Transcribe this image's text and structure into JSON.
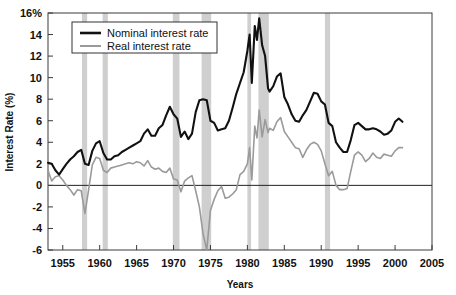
{
  "chart_data": {
    "type": "line",
    "title": "",
    "xlabel": "Years",
    "ylabel": "Interest Rate (%)",
    "xlim": [
      1953,
      2005
    ],
    "ylim": [
      -6,
      16
    ],
    "grid": false,
    "legend_position": "top-left-inside",
    "x_ticks": [
      1955,
      1960,
      1965,
      1970,
      1975,
      1980,
      1985,
      1990,
      1995,
      2000,
      2005
    ],
    "x_tick_labels": [
      "1955",
      "1960",
      "1965",
      "1970",
      "1975",
      "1980",
      "1985",
      "1990",
      "1995",
      "2000",
      "2005"
    ],
    "y_ticks": [
      -6,
      -4,
      -2,
      0,
      2,
      4,
      6,
      8,
      10,
      12,
      14,
      16
    ],
    "y_tick_labels": [
      "-6",
      "-4",
      "-2",
      "0",
      "2",
      "4",
      "6",
      "8",
      "10",
      "12",
      "14",
      "16%"
    ],
    "colors": {
      "nominal": "#111111",
      "real": "#9a9a9a",
      "recession_band": "#cfcfcf",
      "axis": "#3a3a3a",
      "background": "#ffffff"
    },
    "shaded_regions": {
      "name": "recession-bands",
      "spans": [
        [
          1957.6,
          1958.3
        ],
        [
          1960.4,
          1961.1
        ],
        [
          1969.9,
          1970.8
        ],
        [
          1973.8,
          1975.1
        ],
        [
          1980.0,
          1980.5
        ],
        [
          1981.5,
          1982.9
        ],
        [
          1990.5,
          1991.2
        ]
      ]
    },
    "series": [
      {
        "name": "Nominal interest rate",
        "color": "#111111",
        "x": [
          1953.0,
          1953.5,
          1954.0,
          1954.5,
          1955.0,
          1955.5,
          1956.0,
          1956.5,
          1957.0,
          1957.5,
          1958.0,
          1958.5,
          1959.0,
          1959.5,
          1960.0,
          1960.5,
          1961.0,
          1961.5,
          1962.0,
          1962.5,
          1963.0,
          1963.5,
          1964.0,
          1964.5,
          1965.0,
          1965.5,
          1966.0,
          1966.5,
          1967.0,
          1967.5,
          1968.0,
          1968.5,
          1969.0,
          1969.5,
          1970.0,
          1970.5,
          1971.0,
          1971.5,
          1972.0,
          1972.5,
          1973.0,
          1973.5,
          1974.0,
          1974.5,
          1975.0,
          1975.5,
          1976.0,
          1976.5,
          1977.0,
          1977.5,
          1978.0,
          1978.5,
          1979.0,
          1979.5,
          1980.0,
          1980.3,
          1980.6,
          1981.0,
          1981.3,
          1981.6,
          1982.0,
          1982.4,
          1982.8,
          1983.0,
          1983.5,
          1984.0,
          1984.5,
          1985.0,
          1985.5,
          1986.0,
          1986.5,
          1987.0,
          1987.5,
          1988.0,
          1988.5,
          1989.0,
          1989.5,
          1990.0,
          1990.5,
          1991.0,
          1991.5,
          1992.0,
          1992.5,
          1993.0,
          1993.5,
          1994.0,
          1994.5,
          1995.0,
          1995.5,
          1996.0,
          1996.5,
          1997.0,
          1997.5,
          1998.0,
          1998.5,
          1999.0,
          1999.5,
          2000.0,
          2000.5,
          2001.0
        ],
        "y": [
          2.1,
          2.0,
          1.4,
          1.0,
          1.5,
          2.0,
          2.4,
          2.7,
          3.1,
          3.3,
          2.0,
          1.9,
          3.2,
          3.9,
          4.1,
          3.0,
          2.4,
          2.4,
          2.7,
          2.8,
          3.1,
          3.3,
          3.5,
          3.7,
          3.9,
          4.1,
          4.8,
          5.2,
          4.6,
          4.6,
          5.3,
          5.6,
          6.5,
          7.3,
          6.6,
          6.2,
          4.5,
          5.0,
          4.3,
          4.8,
          6.8,
          7.9,
          8.0,
          7.9,
          6.0,
          5.8,
          5.1,
          5.2,
          5.3,
          6.0,
          7.2,
          8.5,
          9.5,
          10.5,
          12.5,
          14.0,
          9.5,
          14.8,
          13.5,
          15.5,
          13.0,
          12.0,
          9.0,
          8.7,
          9.2,
          10.1,
          10.4,
          8.2,
          7.5,
          6.6,
          6.0,
          5.9,
          6.5,
          7.0,
          7.8,
          8.6,
          8.5,
          7.8,
          7.5,
          5.8,
          5.5,
          4.0,
          3.5,
          3.1,
          3.1,
          4.2,
          5.6,
          5.8,
          5.5,
          5.2,
          5.2,
          5.3,
          5.2,
          5.0,
          4.7,
          4.8,
          5.1,
          5.9,
          6.2,
          5.9
        ]
      },
      {
        "name": "Real interest rate",
        "color": "#9a9a9a",
        "x": [
          1953.0,
          1953.5,
          1954.0,
          1954.5,
          1955.0,
          1955.5,
          1956.0,
          1956.5,
          1957.0,
          1957.5,
          1958.0,
          1958.5,
          1959.0,
          1959.5,
          1960.0,
          1960.5,
          1961.0,
          1961.5,
          1962.0,
          1962.5,
          1963.0,
          1963.5,
          1964.0,
          1964.5,
          1965.0,
          1965.5,
          1966.0,
          1966.5,
          1967.0,
          1967.5,
          1968.0,
          1968.5,
          1969.0,
          1969.5,
          1970.0,
          1970.5,
          1971.0,
          1971.5,
          1972.0,
          1972.5,
          1973.0,
          1973.5,
          1974.0,
          1974.5,
          1975.0,
          1975.5,
          1976.0,
          1976.5,
          1977.0,
          1977.5,
          1978.0,
          1978.5,
          1979.0,
          1979.5,
          1980.0,
          1980.3,
          1980.6,
          1981.0,
          1981.3,
          1981.6,
          1982.0,
          1982.4,
          1982.8,
          1983.0,
          1983.5,
          1984.0,
          1984.5,
          1985.0,
          1985.5,
          1986.0,
          1986.5,
          1987.0,
          1987.5,
          1988.0,
          1988.5,
          1989.0,
          1989.5,
          1990.0,
          1990.5,
          1991.0,
          1991.5,
          1992.0,
          1992.5,
          1993.0,
          1993.5,
          1994.0,
          1994.5,
          1995.0,
          1995.5,
          1996.0,
          1996.5,
          1997.0,
          1997.5,
          1998.0,
          1998.5,
          1999.0,
          1999.5,
          2000.0,
          2000.5,
          2001.0
        ],
        "y": [
          1.4,
          0.4,
          0.8,
          0.9,
          0.5,
          0.0,
          -0.4,
          -0.9,
          -0.4,
          -0.5,
          -2.6,
          -0.4,
          1.9,
          2.6,
          2.5,
          1.4,
          1.2,
          1.6,
          1.7,
          1.8,
          1.9,
          2.0,
          2.1,
          2.0,
          2.2,
          2.1,
          1.8,
          2.3,
          1.7,
          1.5,
          1.6,
          1.3,
          1.2,
          1.6,
          0.6,
          0.5,
          -0.6,
          0.4,
          0.7,
          0.9,
          -0.5,
          -2.0,
          -4.5,
          -6.2,
          -2.3,
          -1.3,
          -0.5,
          -0.1,
          -1.2,
          -1.1,
          -0.8,
          -0.4,
          1.0,
          1.3,
          2.0,
          3.5,
          0.5,
          5.5,
          4.4,
          7.0,
          4.5,
          6.1,
          4.9,
          5.3,
          5.1,
          5.9,
          6.3,
          5.0,
          4.5,
          4.0,
          3.5,
          3.4,
          2.6,
          3.3,
          3.8,
          4.0,
          3.8,
          3.2,
          2.0,
          0.9,
          1.3,
          0.0,
          -0.4,
          -0.4,
          -0.3,
          1.3,
          2.8,
          3.1,
          2.8,
          2.2,
          2.5,
          3.0,
          2.6,
          2.5,
          2.9,
          2.8,
          2.7,
          3.2,
          3.5,
          3.5
        ]
      }
    ]
  },
  "legend": {
    "items": [
      {
        "label": "Nominal interest rate",
        "color": "#111111",
        "style": "thick"
      },
      {
        "label": "Real interest rate",
        "color": "#9a9a9a",
        "style": "thin"
      }
    ]
  },
  "axes": {
    "y_title": "Interest Rate (%)",
    "x_title": "Years"
  }
}
